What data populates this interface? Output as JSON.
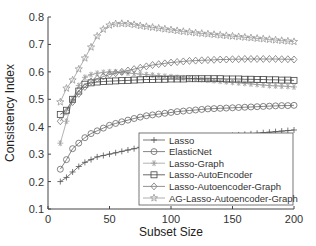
{
  "chart_data": {
    "type": "line",
    "title": "",
    "xlabel": "Subset Size",
    "ylabel": "Consistency Index",
    "xlim": [
      0,
      200
    ],
    "ylim": [
      0.1,
      0.8
    ],
    "xticks": [
      0,
      50,
      100,
      150,
      200
    ],
    "yticks": [
      0.1,
      0.2,
      0.3,
      0.4,
      0.5,
      0.6,
      0.7,
      0.8
    ],
    "grid": false,
    "legend_position": "lower right",
    "x": [
      10,
      15,
      20,
      25,
      30,
      35,
      40,
      45,
      50,
      55,
      60,
      65,
      70,
      75,
      80,
      85,
      90,
      95,
      100,
      105,
      110,
      115,
      120,
      125,
      130,
      135,
      140,
      145,
      150,
      155,
      160,
      165,
      170,
      175,
      180,
      185,
      190,
      195,
      200
    ],
    "series": [
      {
        "name": "Lasso",
        "marker": "plus",
        "color": "#555555",
        "values": [
          0.2,
          0.215,
          0.235,
          0.255,
          0.27,
          0.28,
          0.29,
          0.295,
          0.3,
          0.305,
          0.31,
          0.315,
          0.32,
          0.325,
          0.33,
          0.335,
          0.34,
          0.342,
          0.345,
          0.348,
          0.35,
          0.352,
          0.355,
          0.358,
          0.36,
          0.362,
          0.364,
          0.366,
          0.368,
          0.37,
          0.372,
          0.374,
          0.376,
          0.378,
          0.38,
          0.382,
          0.384,
          0.386,
          0.388
        ]
      },
      {
        "name": "ElasticNet",
        "marker": "circle",
        "color": "#666666",
        "values": [
          0.245,
          0.28,
          0.32,
          0.34,
          0.36,
          0.375,
          0.385,
          0.395,
          0.405,
          0.412,
          0.418,
          0.424,
          0.43,
          0.435,
          0.44,
          0.443,
          0.446,
          0.449,
          0.452,
          0.455,
          0.457,
          0.459,
          0.461,
          0.463,
          0.465,
          0.466,
          0.467,
          0.468,
          0.469,
          0.47,
          0.471,
          0.472,
          0.473,
          0.474,
          0.475,
          0.476,
          0.477,
          0.477,
          0.478
        ]
      },
      {
        "name": "Lasso-Graph",
        "marker": "asterisk",
        "color": "#a0a0a0",
        "values": [
          0.34,
          0.42,
          0.5,
          0.55,
          0.58,
          0.59,
          0.595,
          0.598,
          0.6,
          0.6,
          0.598,
          0.596,
          0.594,
          0.592,
          0.59,
          0.588,
          0.586,
          0.584,
          0.582,
          0.58,
          0.578,
          0.576,
          0.574,
          0.572,
          0.57,
          0.568,
          0.566,
          0.564,
          0.562,
          0.56,
          0.558,
          0.556,
          0.554,
          0.552,
          0.55,
          0.549,
          0.548,
          0.547,
          0.545
        ]
      },
      {
        "name": "Lasso-AutoEncoder",
        "marker": "square",
        "color": "#444444",
        "values": [
          0.445,
          0.46,
          0.5,
          0.53,
          0.555,
          0.56,
          0.563,
          0.565,
          0.566,
          0.567,
          0.568,
          0.569,
          0.57,
          0.571,
          0.572,
          0.572,
          0.573,
          0.573,
          0.574,
          0.574,
          0.574,
          0.575,
          0.575,
          0.575,
          0.575,
          0.575,
          0.575,
          0.574,
          0.574,
          0.574,
          0.573,
          0.573,
          0.572,
          0.572,
          0.571,
          0.571,
          0.57,
          0.57,
          0.569
        ]
      },
      {
        "name": "Lasso-Autoencoder-Graph",
        "marker": "diamond",
        "color": "#777777",
        "values": [
          0.42,
          0.455,
          0.49,
          0.52,
          0.545,
          0.565,
          0.575,
          0.583,
          0.59,
          0.595,
          0.6,
          0.605,
          0.61,
          0.615,
          0.62,
          0.625,
          0.628,
          0.631,
          0.634,
          0.636,
          0.638,
          0.64,
          0.641,
          0.642,
          0.643,
          0.644,
          0.645,
          0.645,
          0.646,
          0.646,
          0.647,
          0.647,
          0.647,
          0.647,
          0.647,
          0.647,
          0.646,
          0.646,
          0.645
        ]
      },
      {
        "name": "AG-Lasso-Autoencoder-Graph",
        "marker": "star",
        "color": "#999999",
        "values": [
          0.49,
          0.54,
          0.57,
          0.61,
          0.65,
          0.69,
          0.73,
          0.755,
          0.77,
          0.775,
          0.776,
          0.775,
          0.772,
          0.768,
          0.765,
          0.762,
          0.759,
          0.756,
          0.753,
          0.75,
          0.747,
          0.745,
          0.742,
          0.74,
          0.738,
          0.736,
          0.734,
          0.732,
          0.73,
          0.728,
          0.726,
          0.724,
          0.722,
          0.72,
          0.718,
          0.716,
          0.714,
          0.712,
          0.71
        ]
      }
    ]
  }
}
